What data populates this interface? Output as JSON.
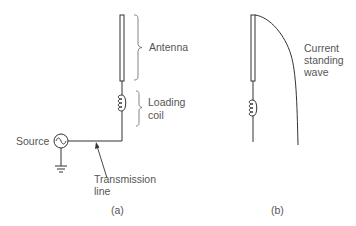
{
  "diagram": {
    "panel_a": {
      "caption": "(a)",
      "labels": {
        "antenna": "Antenna",
        "loading_coil_line1": "Loading",
        "loading_coil_line2": "coil",
        "source": "Source",
        "transmission_line_line1": "Transmission",
        "transmission_line_line2": "line"
      },
      "components": [
        "antenna-rod",
        "loading-coil",
        "ac-source",
        "ground",
        "transmission-line"
      ]
    },
    "panel_b": {
      "caption": "(b)",
      "labels": {
        "current_line1": "Current",
        "current_line2": "standing",
        "current_line3": "wave"
      },
      "components": [
        "antenna-rod",
        "loading-coil",
        "current-standing-wave-curve"
      ]
    },
    "colors": {
      "line": "#333333",
      "text": "#555555",
      "background": "#ffffff"
    }
  }
}
